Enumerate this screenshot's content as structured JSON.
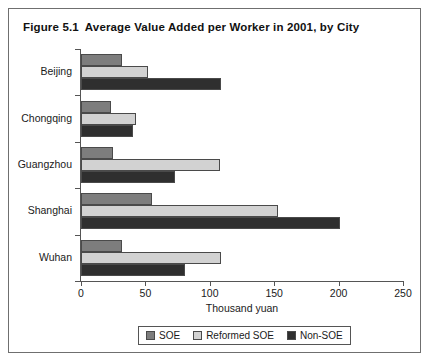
{
  "figure": {
    "number": "Figure 5.1",
    "title": "Average Value Added per Worker in 2001, by City"
  },
  "chart_data": {
    "type": "bar",
    "orientation": "horizontal",
    "title": "Average Value Added per Worker in 2001, by City",
    "xlabel": "Thousand yuan",
    "ylabel": "",
    "categories": [
      "Beijing",
      "Chongqing",
      "Guangzhou",
      "Shanghai",
      "Wuhan"
    ],
    "series": [
      {
        "name": "SOE",
        "color": "#7d7d7d",
        "values": [
          32,
          23,
          25,
          55,
          32
        ]
      },
      {
        "name": "Reformed SOE",
        "color": "#d2d2d2",
        "values": [
          52,
          43,
          108,
          153,
          109
        ]
      },
      {
        "name": "Non-SOE",
        "color": "#2f2f2f",
        "values": [
          109,
          40,
          73,
          201,
          81
        ]
      }
    ],
    "xlim": [
      0,
      250
    ],
    "xticks": [
      0,
      50,
      100,
      150,
      200,
      250
    ],
    "xtick_labels": [
      "0",
      "50",
      "100",
      "150",
      "200",
      "250"
    ],
    "grid": false,
    "legend_position": "bottom"
  }
}
